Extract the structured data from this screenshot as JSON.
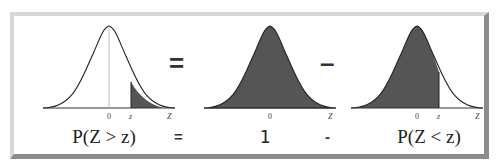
{
  "diagram": {
    "colors": {
      "shade": "#555555",
      "curve": "#222222",
      "axis": "#333333",
      "frame_light": "#d8d8d8",
      "frame_dark": "#8c8c8c"
    },
    "panels": [
      {
        "id": "left",
        "shaded_region": "right-tail",
        "tick_labels": [
          "0",
          "z",
          "Z"
        ],
        "formula": "P(Z > z)"
      },
      {
        "id": "middle",
        "shaded_region": "entire",
        "tick_labels": [
          "0",
          "Z"
        ],
        "formula": "1"
      },
      {
        "id": "right",
        "shaded_region": "left-of-z",
        "tick_labels": [
          "0",
          "z",
          "Z"
        ],
        "formula": "P(Z < z)"
      }
    ],
    "operators": {
      "top_1": "=",
      "top_2": "–",
      "bottom_1": "=",
      "bottom_2": "-"
    }
  }
}
